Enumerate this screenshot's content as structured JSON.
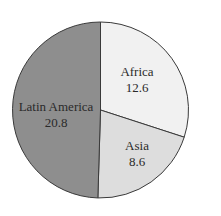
{
  "chart_data": {
    "type": "pie",
    "title": "",
    "start_angle_deg": 0,
    "direction": "clockwise",
    "slices": [
      {
        "label": "Africa",
        "value": 12.6,
        "color": "#f1f1f1"
      },
      {
        "label": "Asia",
        "value": 8.6,
        "color": "#dddddd"
      },
      {
        "label": "Latin America",
        "value": 20.8,
        "color": "#8e8e8e"
      }
    ],
    "labels": [
      "Africa",
      "Asia",
      "Latin America"
    ],
    "values": [
      12.6,
      8.6,
      20.8
    ],
    "legend": "none",
    "value_labels_inside": true
  },
  "display": {
    "africa_label": "Africa",
    "africa_value": "12.6",
    "asia_label": "Asia",
    "asia_value": "8.6",
    "latam_label": "Latin America",
    "latam_value": "20.8"
  }
}
